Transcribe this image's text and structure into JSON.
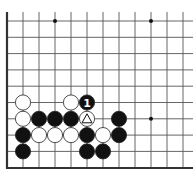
{
  "diagram": {
    "type": "go-board-fragment",
    "visible_columns": 12,
    "visible_rows": 10,
    "edges": [
      "left",
      "bottom"
    ],
    "colors": {
      "background": "#ffffff",
      "line": "#555555",
      "edge": "#333333",
      "black": "#111111",
      "white": "#ffffff"
    },
    "star_points": [
      [
        3,
        0
      ],
      [
        9,
        0
      ],
      [
        9,
        6
      ]
    ],
    "stones": [
      {
        "col": 1,
        "row": 5,
        "color": "white"
      },
      {
        "col": 4,
        "row": 5,
        "color": "white"
      },
      {
        "col": 5,
        "row": 5,
        "color": "black",
        "label": "1"
      },
      {
        "col": 1,
        "row": 6,
        "color": "white"
      },
      {
        "col": 2,
        "row": 6,
        "color": "black"
      },
      {
        "col": 3,
        "row": 6,
        "color": "black"
      },
      {
        "col": 4,
        "row": 6,
        "color": "black"
      },
      {
        "col": 5,
        "row": 6,
        "color": "white",
        "mark": "triangle"
      },
      {
        "col": 7,
        "row": 6,
        "color": "black"
      },
      {
        "col": 1,
        "row": 7,
        "color": "black"
      },
      {
        "col": 2,
        "row": 7,
        "color": "white"
      },
      {
        "col": 3,
        "row": 7,
        "color": "white"
      },
      {
        "col": 4,
        "row": 7,
        "color": "white"
      },
      {
        "col": 5,
        "row": 7,
        "color": "black"
      },
      {
        "col": 6,
        "row": 7,
        "color": "white"
      },
      {
        "col": 7,
        "row": 7,
        "color": "black"
      },
      {
        "col": 1,
        "row": 8,
        "color": "black"
      },
      {
        "col": 5,
        "row": 8,
        "color": "black"
      },
      {
        "col": 6,
        "row": 8,
        "color": "black"
      }
    ]
  }
}
